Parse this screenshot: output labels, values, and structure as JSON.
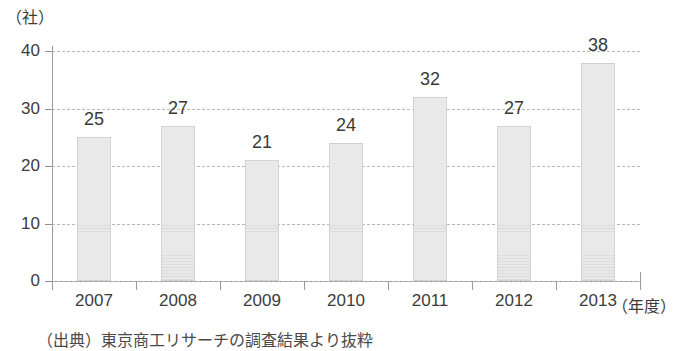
{
  "chart_data": {
    "type": "bar",
    "title": "",
    "subtitle": "",
    "categories": [
      "2007",
      "2008",
      "2009",
      "2010",
      "2011",
      "2012",
      "2013"
    ],
    "values": [
      25,
      27,
      21,
      24,
      32,
      27,
      38
    ],
    "xlabel": "（年度）",
    "ylabel": "（社）",
    "ylim": [
      0,
      40
    ],
    "yticks": [
      0,
      10,
      20,
      30,
      40
    ],
    "ytick_labels": [
      "0",
      "10",
      "20",
      "30",
      "40"
    ],
    "grid": true,
    "grid_style": "dashed-horizontal",
    "legend": null,
    "legend_position": "none",
    "data_labels": [
      "25",
      "27",
      "21",
      "24",
      "32",
      "27",
      "38"
    ],
    "bar_fill_color": "#e9e9e9",
    "bar_border_color": "#d2d2d2",
    "axis_color": "#9a9a9a",
    "grid_color": "#b9b9b9",
    "text_color": "#3a3a3a"
  },
  "annotations": {
    "source_caption": "（出典）東京商工リサーチの調査結果より抜粋"
  }
}
